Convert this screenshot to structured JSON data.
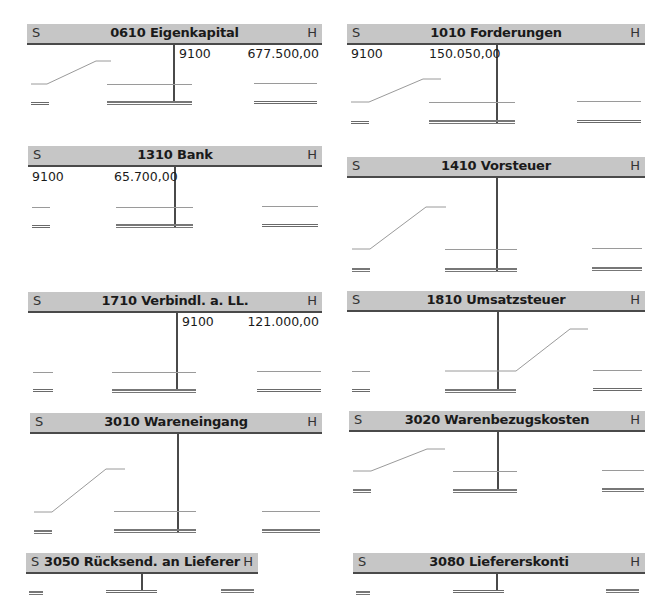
{
  "side_labels": {
    "debit": "S",
    "credit": "H"
  },
  "accounts": [
    {
      "id": "0610",
      "title": "0610 Eigenkapital",
      "debit_entries": [],
      "credit_entries": [
        {
          "contra": "9100",
          "amount": "677.500,00"
        }
      ]
    },
    {
      "id": "1010",
      "title": "1010 Forderungen",
      "debit_entries": [
        {
          "contra": "9100",
          "amount": "150.050,00"
        }
      ],
      "credit_entries": []
    },
    {
      "id": "1310",
      "title": "1310 Bank",
      "debit_entries": [
        {
          "contra": "9100",
          "amount": "65.700,00"
        }
      ],
      "credit_entries": []
    },
    {
      "id": "1410",
      "title": "1410 Vorsteuer",
      "debit_entries": [],
      "credit_entries": []
    },
    {
      "id": "1710",
      "title": "1710 Verbindl. a. LL.",
      "debit_entries": [],
      "credit_entries": [
        {
          "contra": "9100",
          "amount": "121.000,00"
        }
      ]
    },
    {
      "id": "1810",
      "title": "1810 Umsatzsteuer",
      "debit_entries": [],
      "credit_entries": []
    },
    {
      "id": "3010",
      "title": "3010 Wareneingang",
      "debit_entries": [],
      "credit_entries": []
    },
    {
      "id": "3020",
      "title": "3020 Warenbezugskosten",
      "debit_entries": [],
      "credit_entries": []
    },
    {
      "id": "3050",
      "title": "3050 Rücksend. an Lieferer",
      "debit_entries": [],
      "credit_entries": []
    },
    {
      "id": "3080",
      "title": "3080 Liefererskonti",
      "debit_entries": [],
      "credit_entries": []
    }
  ]
}
